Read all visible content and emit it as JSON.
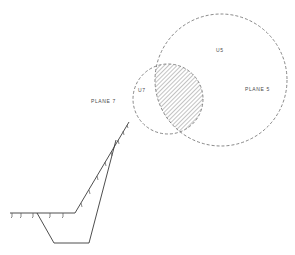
{
  "diagram": {
    "labels": {
      "u5": "U5",
      "u7": "U7",
      "plane5": "PLANE 5",
      "plane7": "PLANE 7"
    },
    "colors": {
      "line": "#3a3a3a",
      "dashed": "#6a6a6a",
      "hatch": "#7a7a7a",
      "background": "#ffffff"
    },
    "circles": [
      {
        "id": "u5",
        "cx": 221,
        "cy": 80,
        "r": 66,
        "style": "dashed"
      },
      {
        "id": "u7",
        "cx": 168,
        "cy": 99,
        "r": 35,
        "style": "dashed"
      }
    ],
    "hatched_region": "intersection of U5 and U7 circles",
    "profile": {
      "description": "ground surface profile with excavated trench",
      "surface_points": [
        [
          10,
          213
        ],
        [
          75,
          213
        ],
        [
          129,
          122
        ]
      ],
      "trench_points": [
        [
          37,
          213
        ],
        [
          54,
          243
        ],
        [
          89,
          243
        ],
        [
          116,
          140
        ]
      ]
    }
  }
}
